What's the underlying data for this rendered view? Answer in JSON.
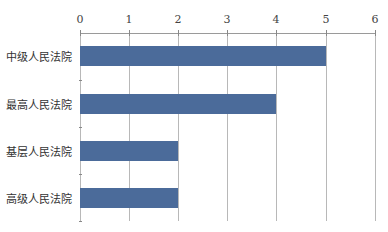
{
  "chart_data": {
    "type": "bar",
    "orientation": "horizontal",
    "title": "",
    "xlabel": "",
    "ylabel": "",
    "categories": [
      "中级人民法院",
      "最高人民法院",
      "基层人民法院",
      "高级人民法院"
    ],
    "values": [
      5,
      4,
      2,
      2
    ],
    "xlim": [
      0,
      6
    ],
    "x_ticks": [
      "0",
      "1",
      "2",
      "3",
      "4",
      "5",
      "6"
    ],
    "axis_position": "top",
    "grid": true,
    "legend": null,
    "bar_color": "#4b6b9a"
  }
}
